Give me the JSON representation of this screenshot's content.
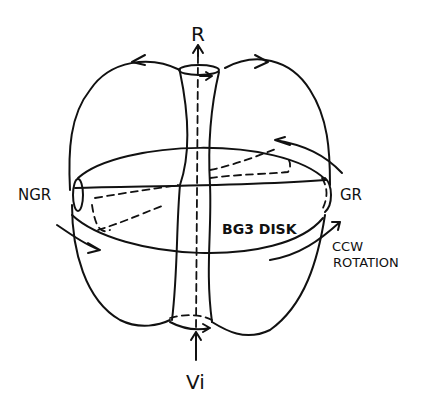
{
  "diagram": {
    "labels": {
      "top": "R",
      "bottom": "Vi",
      "left": "NGR",
      "right": "GR",
      "disk": "BG3 DISK",
      "rotation_line1": "CCW",
      "rotation_line2": "ROTATION"
    }
  }
}
